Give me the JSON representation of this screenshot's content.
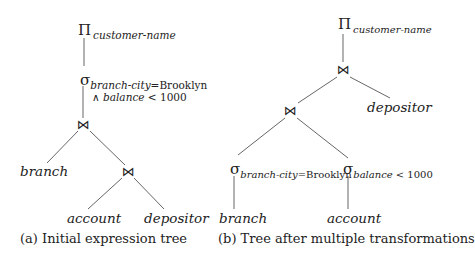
{
  "tree_a": {
    "caption": "(a) Initial expression tree",
    "projection": {
      "symbol": "Π",
      "attribute": "customer-name"
    },
    "selection": {
      "symbol": "σ",
      "condition_attr": "branch-city",
      "condition_rest": "=Brooklyn",
      "and_symbol": "∧",
      "condition2_attr": "balance",
      "condition2_rest": "< 1000"
    },
    "join_top": "⋈",
    "join_bottom": "⋈",
    "leaves": {
      "branch": "branch",
      "account": "account",
      "depositor": "depositor"
    }
  },
  "tree_b": {
    "caption": "(b) Tree after multiple transformations",
    "projection": {
      "symbol": "Π",
      "attribute": "customer-name"
    },
    "join_top": "⋈",
    "join_lower": "⋈",
    "selection_left": {
      "symbol": "σ",
      "condition_attr": "branch-city",
      "condition_rest": "=Brooklyn"
    },
    "selection_right": {
      "symbol": "σ",
      "condition_attr": "balance",
      "condition_rest": "< 1000"
    },
    "leaves": {
      "branch": "branch",
      "account": "account",
      "depositor": "depositor"
    }
  },
  "colors": {
    "line": "#555555",
    "text": "#222222"
  }
}
